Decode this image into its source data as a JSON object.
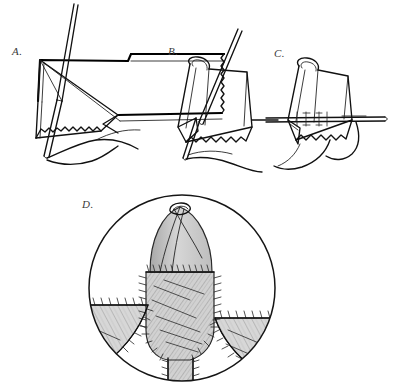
{
  "figure": {
    "style": "pen-and-ink line drawing with graphite shading",
    "background_color": "#ffffff",
    "ink_color": "#1a1a1a",
    "shade_color": "#b9b9b9",
    "panels": [
      {
        "id": "A",
        "label": "A.",
        "caption": "Needle passed through folded tissue edge with serrated cut margin",
        "elements": [
          "needle",
          "suture-thread",
          "tissue-flap",
          "serrated-edge",
          "fold-line"
        ]
      },
      {
        "id": "B",
        "label": "B.",
        "caption": "Tissue flap folded over, needle engaging both layers",
        "elements": [
          "needle",
          "suture-thread",
          "folded-tissue",
          "serrated-edge",
          "loop"
        ]
      },
      {
        "id": "C",
        "label": "C.",
        "caption": "Horizontal needle pass with interrupted stitch markers",
        "elements": [
          "needle",
          "suture-thread",
          "stitch-markers",
          "folded-tissue",
          "loop"
        ]
      },
      {
        "id": "D",
        "label": "D.",
        "caption": "Circular detail inset: completed closure with running sutures on shaded tissue",
        "elements": [
          "circle-frame",
          "tissue-shading",
          "running-suture",
          "lateral-flaps",
          "central-column",
          "folded-tip"
        ]
      }
    ],
    "labels": {
      "a": "A.",
      "b": "B.",
      "c": "C.",
      "d": "D."
    }
  }
}
